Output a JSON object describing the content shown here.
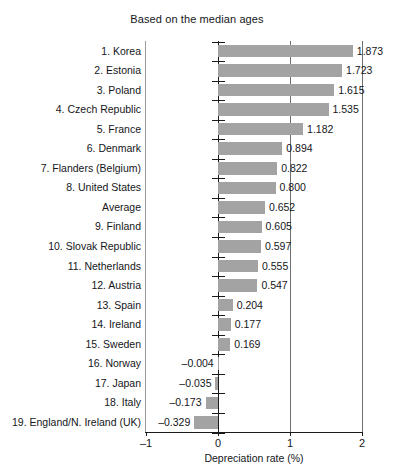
{
  "chart_data": {
    "type": "bar",
    "orientation": "horizontal",
    "title": "Based on the median ages",
    "xlabel": "Depreciation rate (%)",
    "ylabel": "",
    "xlim": [
      -1,
      2
    ],
    "xticks": [
      "-1",
      "0",
      "1",
      "2"
    ],
    "xtick_values": [
      -1,
      0,
      1,
      2
    ],
    "grid": "vertical",
    "legend": "none",
    "bar_color": "#a3a3a3",
    "categories": [
      "1. Korea",
      "2. Estonia",
      "3. Poland",
      "4. Czech Republic",
      "5. France",
      "6. Denmark",
      "7. Flanders (Belgium)",
      "8. United States",
      "Average",
      "9. Finland",
      "10. Slovak Republic",
      "11. Netherlands",
      "12. Austria",
      "13. Spain",
      "14. Ireland",
      "15. Sweden",
      "16. Norway",
      "17. Japan",
      "18. Italy",
      "19. England/N. Ireland (UK)"
    ],
    "values": [
      1.873,
      1.723,
      1.615,
      1.535,
      1.182,
      0.894,
      0.822,
      0.8,
      0.652,
      0.605,
      0.597,
      0.555,
      0.547,
      0.204,
      0.177,
      0.169,
      -0.004,
      -0.035,
      -0.173,
      -0.329
    ],
    "value_labels": [
      "1.873",
      "1.723",
      "1.615",
      "1.535",
      "1.182",
      "0.894",
      "0.822",
      "0.800",
      "0.652",
      "0.605",
      "0.597",
      "0.555",
      "0.547",
      "0.204",
      "0.177",
      "0.169",
      "–0.004",
      "–0.035",
      "–0.173",
      "–0.329"
    ]
  }
}
